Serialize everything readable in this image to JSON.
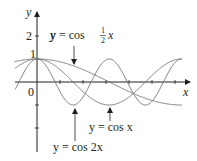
{
  "chart_data": {
    "type": "line",
    "title": "",
    "xlabel": "x",
    "ylabel": "y",
    "x_range": [
      -1,
      6.4
    ],
    "y_range": [
      -3,
      3
    ],
    "origin_label": "0",
    "y_tick_labels": [
      "1",
      "2"
    ],
    "x_ticks": [
      1,
      2,
      3,
      4,
      5,
      6
    ],
    "y_ticks": [
      -2,
      -1,
      1,
      2
    ],
    "grid": false,
    "series": [
      {
        "name": "y = cos ½x",
        "expr": "cos(x/2)",
        "label_parts": {
          "lhs": "y = cos ",
          "num": "1",
          "den": "2",
          "var": "x"
        }
      },
      {
        "name": "y = cos x",
        "expr": "cos(x)",
        "label": "y = cos x"
      },
      {
        "name": "y = cos 2x",
        "expr": "cos(2x)",
        "label": "y = cos 2x"
      }
    ]
  },
  "labels": {
    "y_axis": "y",
    "x_axis": "x",
    "origin": "0",
    "tick_1": "1",
    "tick_2": "2",
    "cos_half_lhs": "y = cos",
    "cos_half_num": "1",
    "cos_half_den": "2",
    "cos_half_var": "x",
    "cos_x": "y = cos x",
    "cos_2x": "y = cos 2x"
  },
  "colors": {
    "curve": "#7a7a7a",
    "axis": "#231f20"
  }
}
